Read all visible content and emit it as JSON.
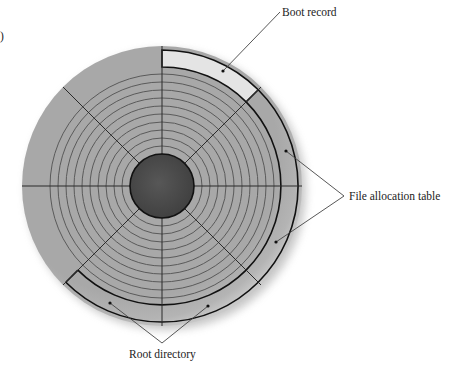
{
  "diagram": {
    "labels": {
      "boot_record": "Boot record",
      "file_allocation_table": "File allocation table",
      "root_directory": "Root directory"
    },
    "figure_mark": ")",
    "colors": {
      "background": "#ffffff",
      "disk_fill": "#a9a9a9",
      "disk_rim_light": "#c4c4c4",
      "track_line": "#555555",
      "radial_line": "#2a2a2a",
      "hub_fill": "#4a4a4a",
      "boot_record_fill": "#e6e6e6",
      "band_outline": "#111111",
      "leader_line": "#444444",
      "shadow": "#8a8a8a"
    },
    "geometry": {
      "center": [
        162,
        186
      ],
      "disk_radius": 140,
      "band_inner_radius": 119,
      "band_outer_radius": 136,
      "hub_radius": 32,
      "track_count": 10,
      "sector_count": 8
    }
  }
}
